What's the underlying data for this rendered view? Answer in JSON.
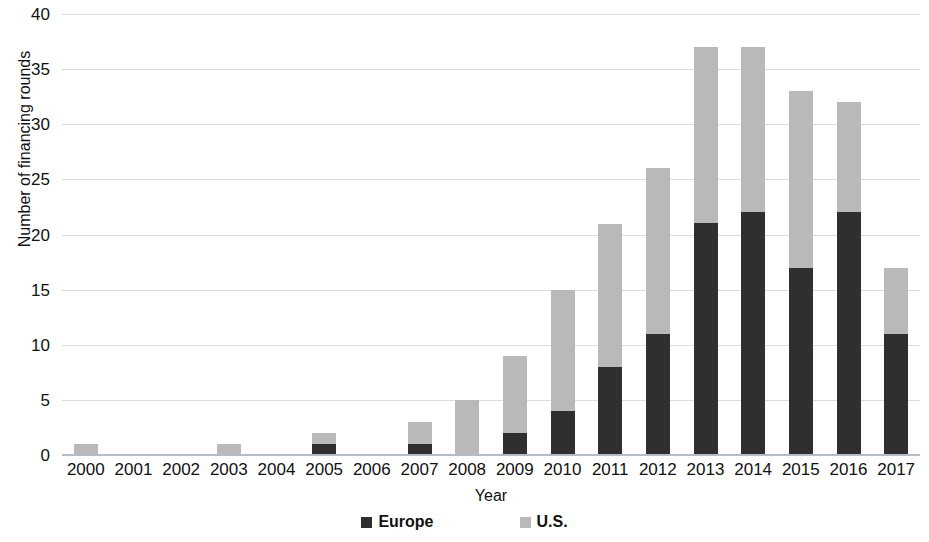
{
  "chart_data": {
    "type": "bar",
    "subtype": "stacked-bar",
    "title": "",
    "xlabel": "Year",
    "ylabel": "Number of financing rounds",
    "categories": [
      "2000",
      "2001",
      "2002",
      "2003",
      "2004",
      "2005",
      "2006",
      "2007",
      "2008",
      "2009",
      "2010",
      "2011",
      "2012",
      "2013",
      "2014",
      "2015",
      "2016",
      "2017"
    ],
    "series": [
      {
        "name": "Europe",
        "color": "#2f2f2f",
        "values": [
          0,
          0,
          0,
          0,
          0,
          1,
          0,
          1,
          0,
          2,
          4,
          8,
          11,
          21,
          22,
          17,
          22,
          11
        ]
      },
      {
        "name": "U.S.",
        "color": "#b9b9b9",
        "values": [
          1,
          0,
          0,
          1,
          0,
          1,
          0,
          2,
          5,
          7,
          11,
          13,
          15,
          16,
          15,
          16,
          10,
          6
        ]
      }
    ],
    "totals": [
      1,
      0,
      0,
      1,
      0,
      2,
      0,
      3,
      5,
      9,
      15,
      21,
      26,
      37,
      37,
      33,
      32,
      17
    ],
    "ylim": [
      0,
      40
    ],
    "ytick_step": 5,
    "yticks": [
      "40",
      "35",
      "30",
      "25",
      "20",
      "15",
      "10",
      "5",
      "0"
    ],
    "grid": true,
    "legend_position": "bottom"
  },
  "legend": {
    "items": [
      {
        "label": "Europe",
        "color": "#2f2f2f"
      },
      {
        "label": "U.S.",
        "color": "#b9b9b9"
      }
    ]
  }
}
